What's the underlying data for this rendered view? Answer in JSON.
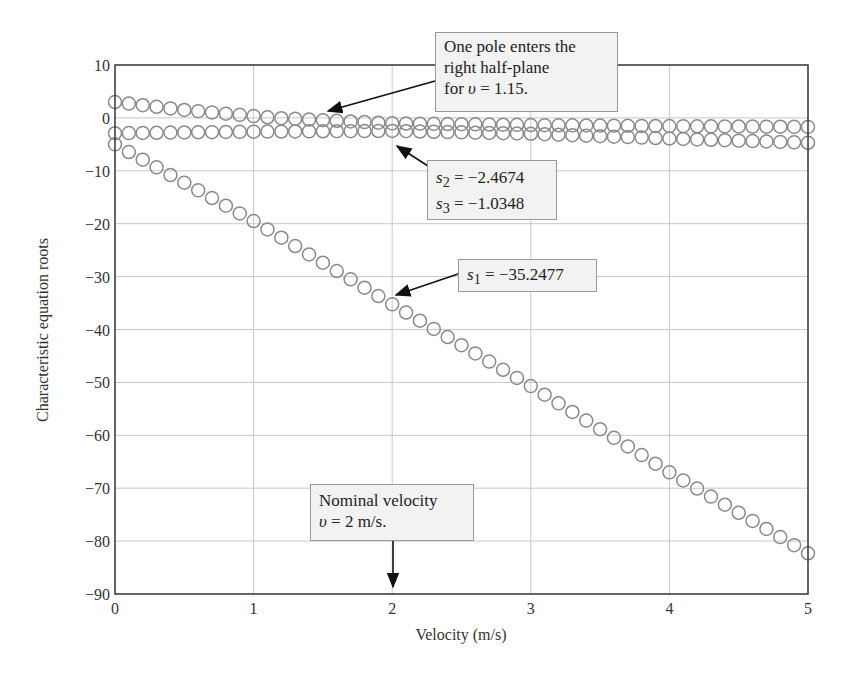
{
  "chart_data": {
    "type": "scatter",
    "title": "",
    "xlabel": "Velocity (m/s)",
    "ylabel": "Characteristic equation roots",
    "xlim": [
      0,
      5
    ],
    "ylim": [
      -90,
      10
    ],
    "grid": true,
    "x_ticks": [
      "0",
      "1",
      "2",
      "3",
      "4",
      "5"
    ],
    "y_ticks": [
      "10",
      "0",
      "−10",
      "−20",
      "−30",
      "−40",
      "−50",
      "−60",
      "−70",
      "−80",
      "−90"
    ],
    "marker": "open-circle",
    "x": [
      0,
      0.1,
      0.2,
      0.3,
      0.4,
      0.5,
      0.6,
      0.7,
      0.8,
      0.9,
      1.0,
      1.1,
      1.2,
      1.3,
      1.4,
      1.5,
      1.6,
      1.7,
      1.8,
      1.9,
      2.0,
      2.1,
      2.2,
      2.3,
      2.4,
      2.5,
      2.6,
      2.7,
      2.8,
      2.9,
      3.0,
      3.1,
      3.2,
      3.3,
      3.4,
      3.5,
      3.6,
      3.7,
      3.8,
      3.9,
      4.0,
      4.1,
      4.2,
      4.3,
      4.4,
      4.5,
      4.6,
      4.7,
      4.8,
      4.9,
      5.0
    ],
    "series": [
      {
        "name": "s1",
        "keypoints": [
          [
            0,
            -5.0
          ],
          [
            1,
            -19.5
          ],
          [
            2,
            -35.2477
          ],
          [
            3,
            -50.7
          ],
          [
            4,
            -67.0
          ],
          [
            5,
            -82.3
          ]
        ]
      },
      {
        "name": "s2",
        "keypoints": [
          [
            0,
            -2.9
          ],
          [
            1,
            -2.6
          ],
          [
            2,
            -2.4674
          ],
          [
            3,
            -3.0
          ],
          [
            4,
            -3.9
          ],
          [
            5,
            -4.7
          ]
        ]
      },
      {
        "name": "s3",
        "keypoints": [
          [
            0,
            3.0
          ],
          [
            0.5,
            1.5
          ],
          [
            1.15,
            0.0
          ],
          [
            2,
            -1.0348
          ],
          [
            3,
            -1.35
          ],
          [
            4,
            -1.55
          ],
          [
            5,
            -1.7
          ]
        ]
      }
    ],
    "annotations": [
      {
        "id": "rhp",
        "lines": [
          "One pole enters the",
          "right half-plane",
          "for υ = 1.15."
        ],
        "points_to": [
          1.5,
          0.0
        ]
      },
      {
        "id": "s2s3",
        "lines": [
          "s₂ = −2.4674",
          "s₃ = −1.0348"
        ],
        "points_to": [
          2.0,
          -1.5
        ]
      },
      {
        "id": "s1",
        "lines": [
          "s₁ = −35.2477"
        ],
        "points_to": [
          2.0,
          -35.2477
        ]
      },
      {
        "id": "nominal",
        "lines": [
          "Nominal velocity",
          "υ = 2 m/s."
        ],
        "points_to": [
          2.0,
          -90
        ]
      }
    ]
  },
  "callouts": {
    "rhp": {
      "l1": "One pole enters the",
      "l2": "right half-plane",
      "l3_pre": "for ",
      "l3_var": "υ",
      "l3_post": " = 1.15."
    },
    "s2s3": {
      "s2_sym": "s",
      "s2_sub": "2",
      "s2_val": " = −2.4674",
      "s3_sym": "s",
      "s3_sub": "3",
      "s3_val": " = −1.0348"
    },
    "s1": {
      "sym": "s",
      "sub": "1",
      "val": " = −35.2477"
    },
    "nominal": {
      "l1": "Nominal velocity",
      "l2_var": "υ",
      "l2_post": " = 2 m/s."
    }
  },
  "colors": {
    "marker": "#8a8a8a",
    "grid": "#c8c8c8",
    "axis": "#333333",
    "callout_bg": "#f2f2f2",
    "callout_border": "#9a9a9a"
  }
}
